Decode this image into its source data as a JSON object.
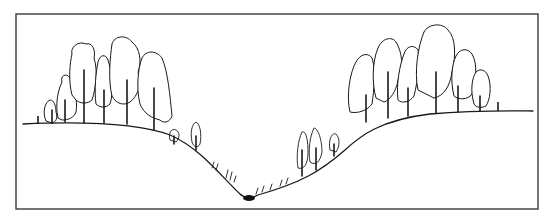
{
  "figure": {
    "frame": {
      "x": 16,
      "y": 14,
      "w": 522,
      "h": 195
    },
    "colors": {
      "line": "#1a1a1a",
      "frame": "#3a3a3a",
      "background": "#ffffff",
      "stream": "#111111"
    }
  },
  "terrain": {
    "profile": "M23,124 C90,121 140,124 170,135 C200,148 220,175 240,194 C244,198 252,199 258,195 C300,183 320,172 345,150 C360,136 380,120 430,114 C480,110 520,111 533,111",
    "stream": {
      "cx": 249,
      "cy": 198,
      "rx": 6,
      "ry": 3
    }
  },
  "trees": [
    {
      "side": "left",
      "crown": "M46,121 C42,112 45,102 50,100 C54,100 56,106 56,112 C58,118 56,122 52,123 Z",
      "trunk": [
        52,
        110,
        52,
        123
      ]
    },
    {
      "side": "left",
      "crown": "M58,118 C55,104 58,90 62,82 C60,76 66,72 70,78 C74,86 78,100 76,112 C74,118 68,120 62,120 Z",
      "trunk": [
        65,
        100,
        65,
        122
      ]
    },
    {
      "side": "left",
      "crown": "M72,95 C68,80 70,62 72,54 C70,48 78,40 86,44 C92,42 96,50 94,58 C98,70 96,88 92,100 C88,104 80,104 76,100 Z",
      "trunk": [
        84,
        70,
        84,
        123
      ]
    },
    {
      "side": "left",
      "crown": "M96,104 C94,90 96,72 98,62 C100,54 106,54 108,60 C112,72 114,92 110,104 C106,108 100,108 96,104 Z",
      "trunk": [
        104,
        90,
        104,
        123
      ]
    },
    {
      "side": "left",
      "crown": "M112,96 C108,80 110,58 112,44 C114,36 126,34 132,42 C140,48 142,62 138,72 C142,84 138,96 130,102 C124,106 116,104 112,96 Z",
      "trunk": [
        127,
        80,
        127,
        124
      ]
    },
    {
      "side": "left",
      "crown": "M140,104 C136,88 138,68 142,58 C146,50 156,50 162,58 C168,72 170,96 172,116 C170,122 164,124 160,120 C152,118 144,114 140,104 Z",
      "trunk": [
        154,
        88,
        154,
        130
      ]
    },
    {
      "side": "right",
      "crown": "M350,112 C346,96 350,72 356,62 C360,54 368,52 372,58 C376,70 374,90 372,104 C368,110 358,114 350,112 Z",
      "trunk": [
        366,
        95,
        366,
        122
      ]
    },
    {
      "side": "right",
      "crown": "M376,98 C372,84 372,62 378,48 C382,38 392,36 396,42 C402,52 404,66 398,80 C396,92 390,100 384,102 Z",
      "trunk": [
        388,
        72,
        388,
        118
      ]
    },
    {
      "side": "right",
      "crown": "M398,100 C396,84 400,64 404,54 C406,46 414,44 418,50 C420,62 418,80 414,96 C410,102 402,104 398,100 Z",
      "trunk": [
        408,
        88,
        408,
        116
      ]
    },
    {
      "side": "right",
      "crown": "M418,90 C414,72 418,46 424,32 C428,24 442,22 448,30 C456,38 456,56 452,72 C450,86 444,96 434,98 Z",
      "trunk": [
        436,
        72,
        436,
        113
      ]
    },
    {
      "side": "right",
      "crown": "M454,96 C450,80 452,64 456,56 C460,48 468,48 472,54 C478,64 476,82 472,94 C468,100 458,100 454,96 Z",
      "trunk": [
        458,
        86,
        458,
        112
      ]
    },
    {
      "side": "right",
      "crown": "M474,104 C470,90 472,78 476,72 C480,68 486,70 488,76 C492,86 490,100 486,106 C482,108 476,108 474,104 Z",
      "trunk": [
        480,
        96,
        480,
        111
      ]
    }
  ],
  "slope_shrubs": [
    {
      "crown": "M170,140 C168,132 172,128 176,130 C180,132 180,138 176,142 Z",
      "trunk": [
        174,
        136,
        174,
        144
      ]
    },
    {
      "crown": "M192,142 C190,132 192,124 196,122 C200,124 202,134 200,144 C198,148 194,148 192,142 Z",
      "trunk": [
        196,
        136,
        196,
        150
      ]
    },
    {
      "crown": "M298,168 C296,156 298,140 302,132 C306,130 308,140 308,152 C308,164 304,170 298,168 Z",
      "trunk": [
        302,
        150,
        302,
        176
      ]
    },
    {
      "crown": "M310,162 C308,150 310,136 314,128 C318,128 322,140 322,152 C320,162 316,166 310,162 Z",
      "trunk": [
        316,
        148,
        316,
        170
      ]
    },
    {
      "crown": "M330,150 C328,140 332,132 336,134 C340,138 340,146 336,152 Z",
      "trunk": [
        334,
        144,
        334,
        156
      ]
    }
  ],
  "grass_tufts": [
    "M226,178 L228,170 M230,180 L232,172 M234,182 L236,176",
    "M256,194 L258,188 M262,192 L264,186 M270,190 L272,184",
    "M280,186 L282,180 M286,184 L288,178",
    "M212,168 L214,162 M216,170 L218,164"
  ],
  "posts": [
    {
      "x1": 38,
      "y1": 116,
      "x2": 38,
      "y2": 124
    },
    {
      "x1": 498,
      "y1": 102,
      "x2": 498,
      "y2": 111
    }
  ]
}
